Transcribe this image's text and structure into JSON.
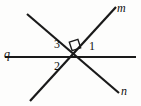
{
  "figure": {
    "type": "geometry-diagram",
    "background_color": "#fdfdfc",
    "stroke_color": "#1a1a1a",
    "width": 141,
    "height": 106,
    "intersection_point": {
      "x": 75,
      "y": 57
    },
    "lines": [
      {
        "name": "q",
        "label": "q",
        "label_style": "italic",
        "x1": 5,
        "y1": 57,
        "x2": 136,
        "y2": 57,
        "stroke_width": 2.2
      },
      {
        "name": "m",
        "label": "m",
        "label_style": "italic",
        "x1": 30,
        "y1": 101,
        "x2": 116,
        "y2": 7,
        "stroke_width": 2.2
      },
      {
        "name": "n",
        "label": "n",
        "label_style": "italic",
        "x1": 27,
        "y1": 14,
        "x2": 119,
        "y2": 93,
        "stroke_width": 2.2
      }
    ],
    "right_angle_marker": {
      "name": "right-angle-marker",
      "center_x": 75,
      "center_y": 45,
      "size": 9,
      "between": [
        "m",
        "n"
      ]
    },
    "angle_labels": [
      {
        "id": "1",
        "label": "1",
        "x": 89,
        "y": 40,
        "region": "right of intersection, above line q"
      },
      {
        "id": "2",
        "label": "2",
        "x": 54,
        "y": 60,
        "region": "left of intersection, below line q"
      },
      {
        "id": "3",
        "label": "3",
        "x": 54,
        "y": 38,
        "region": "left of intersection, above line q"
      }
    ]
  }
}
